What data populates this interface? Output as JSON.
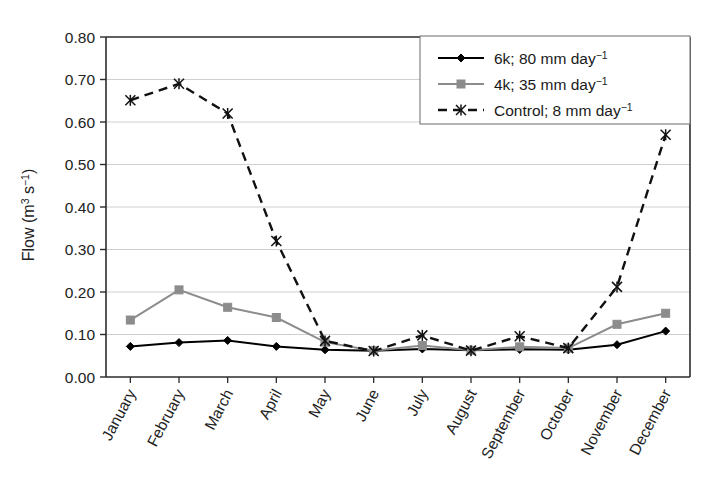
{
  "chart_data": {
    "type": "line",
    "title": "",
    "xlabel": "",
    "ylabel": "Flow (m3 s-1)",
    "ylabel_parts": {
      "base1": "Flow (m",
      "sup1": "3",
      "base2": " s",
      "sup2": "−1",
      "base3": ")"
    },
    "categories": [
      "January",
      "February",
      "March",
      "April",
      "May",
      "June",
      "July",
      "August",
      "September",
      "October",
      "November",
      "December"
    ],
    "ylim": [
      0.0,
      0.8
    ],
    "ytick_step": 0.1,
    "ytick_labels": [
      "0.00",
      "0.10",
      "0.20",
      "0.30",
      "0.40",
      "0.50",
      "0.60",
      "0.70",
      "0.80"
    ],
    "ytick_values": [
      0.0,
      0.1,
      0.2,
      0.3,
      0.4,
      0.5,
      0.6,
      0.7,
      0.8
    ],
    "grid": "horizontal",
    "legend_position": "top-right",
    "series": [
      {
        "name": "6k; 80 mm day-1",
        "label_base": "6k; 80 mm day",
        "label_sup": "−1",
        "color": "#000000",
        "marker": "diamond",
        "dash": "solid",
        "values": [
          0.072,
          0.081,
          0.086,
          0.072,
          0.064,
          0.062,
          0.066,
          0.063,
          0.065,
          0.064,
          0.076,
          0.108
        ]
      },
      {
        "name": "4k; 35 mm day-1",
        "label_base": "4k; 35 mm day",
        "label_sup": "−1",
        "color": "#8c8c8c",
        "marker": "square",
        "dash": "solid",
        "values": [
          0.134,
          0.205,
          0.164,
          0.14,
          0.082,
          0.062,
          0.074,
          0.063,
          0.071,
          0.068,
          0.124,
          0.15
        ]
      },
      {
        "name": "Control; 8 mm day-1",
        "label_base": "Control; 8 mm day",
        "label_sup": "−1",
        "color": "#111111",
        "marker": "star",
        "dash": "dashed",
        "values": [
          0.651,
          0.69,
          0.62,
          0.32,
          0.085,
          0.061,
          0.098,
          0.062,
          0.096,
          0.068,
          0.212,
          0.57
        ]
      }
    ]
  },
  "colors": {
    "axis": "#2b2b2b",
    "grid": "#cfcfcf",
    "background": "#ffffff",
    "series_black": "#000000",
    "series_gray": "#8c8c8c"
  }
}
